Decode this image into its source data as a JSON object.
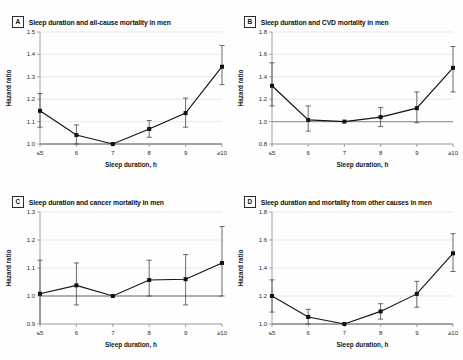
{
  "figure": {
    "xlabel": "Sleep duration, h",
    "ylabel": "Hazard ratio",
    "categories": [
      "≤5",
      "6",
      "7",
      "8",
      "9",
      "≥10"
    ],
    "reference_value": 1.0,
    "colors": {
      "line": "#111111",
      "marker": "#111111",
      "grid": "#d8d8d8",
      "reference": "#9a9a9a",
      "axis": "#8d8d8d"
    }
  },
  "chart_data": [
    {
      "type": "line",
      "panel": "A",
      "title": "Sleep duration and all-cause mortality in men",
      "xlabel": "Sleep duration, h",
      "ylabel": "Hazard ratio",
      "categories": [
        "≤5",
        "6",
        "7",
        "8",
        "9",
        "≥10"
      ],
      "values": [
        1.148,
        1.04,
        1.0,
        1.067,
        1.138,
        1.345
      ],
      "ci_low": [
        1.075,
        1.0,
        1.0,
        1.03,
        1.075,
        1.265
      ],
      "ci_high": [
        1.225,
        1.085,
        1.0,
        1.105,
        1.205,
        1.44
      ],
      "yticks": [
        1.0,
        1.1,
        1.2,
        1.3,
        1.4,
        1.5
      ],
      "ylim": [
        1.0,
        1.5
      ],
      "grid": true,
      "legend": "none"
    },
    {
      "type": "line",
      "panel": "B",
      "title": "Sleep duration and CVD mortality in men",
      "xlabel": "Sleep duration, h",
      "ylabel": "Hazard ratio",
      "categories": [
        "≤5",
        "6",
        "7",
        "8",
        "9",
        "≥10"
      ],
      "values": [
        1.32,
        1.015,
        1.0,
        1.04,
        1.12,
        1.48
      ],
      "ci_low": [
        1.14,
        0.915,
        1.0,
        0.955,
        0.99,
        1.265
      ],
      "ci_high": [
        1.525,
        1.14,
        1.0,
        1.125,
        1.265,
        1.67
      ],
      "yticks": [
        0.8,
        1.0,
        1.2,
        1.4,
        1.6,
        1.8
      ],
      "ylim": [
        0.8,
        1.8
      ],
      "grid": true,
      "legend": "none"
    },
    {
      "type": "line",
      "panel": "C",
      "title": "Sleep duration and cancer mortality in men",
      "xlabel": "Sleep duration, h",
      "ylabel": "Hazard ratio",
      "categories": [
        "≤5",
        "6",
        "7",
        "8",
        "9",
        "≥10"
      ],
      "values": [
        1.008,
        1.038,
        1.0,
        1.057,
        1.06,
        1.118
      ],
      "ci_low": [
        0.898,
        0.968,
        1.0,
        1.0,
        0.968,
        1.0
      ],
      "ci_high": [
        1.128,
        1.118,
        1.0,
        1.128,
        1.148,
        1.248
      ],
      "yticks": [
        0.9,
        1.0,
        1.1,
        1.2,
        1.3
      ],
      "ylim": [
        0.9,
        1.3
      ],
      "grid": true,
      "legend": "none"
    },
    {
      "type": "line",
      "panel": "D",
      "title": "Sleep duration and mortality from other causes in men",
      "xlabel": "Sleep duration, h",
      "ylabel": "Hazard ratio",
      "categories": [
        "≤5",
        "6",
        "7",
        "8",
        "9",
        "≥10"
      ],
      "values": [
        1.2,
        1.05,
        1.0,
        1.09,
        1.215,
        1.505
      ],
      "ci_low": [
        1.085,
        1.0,
        1.0,
        1.035,
        1.12,
        1.375
      ],
      "ci_high": [
        1.315,
        1.105,
        1.0,
        1.145,
        1.305,
        1.645
      ],
      "yticks": [
        1.0,
        1.2,
        1.4,
        1.6,
        1.8
      ],
      "ylim": [
        1.0,
        1.8
      ],
      "grid": true,
      "legend": "none"
    }
  ],
  "panels": [
    {
      "letter": "A",
      "title": "Sleep duration and all-cause mortality in men"
    },
    {
      "letter": "B",
      "title": "Sleep duration and CVD mortality in men"
    },
    {
      "letter": "C",
      "title": "Sleep duration and cancer mortality in men"
    },
    {
      "letter": "D",
      "title": "Sleep duration and mortality from other causes in men"
    }
  ]
}
